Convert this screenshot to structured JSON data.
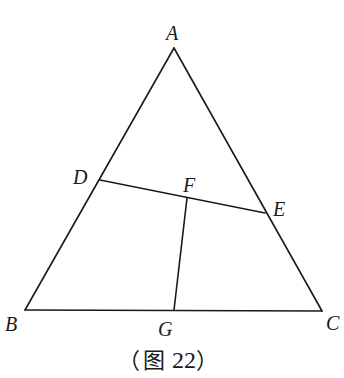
{
  "figure": {
    "caption_open": "（",
    "caption_char": "图",
    "caption_number": "22",
    "caption_close": "）",
    "line_color": "#1a1a1a"
  },
  "points": {
    "A": {
      "label": "A",
      "x": 174,
      "y": 48
    },
    "B": {
      "label": "B",
      "x": 25,
      "y": 310
    },
    "C": {
      "label": "C",
      "x": 322,
      "y": 311
    },
    "D": {
      "label": "D",
      "x": 100,
      "y": 180
    },
    "E": {
      "label": "E",
      "x": 265,
      "y": 213
    },
    "F": {
      "label": "F",
      "x": 187,
      "y": 198
    },
    "G": {
      "label": "G",
      "x": 174,
      "y": 310
    }
  },
  "segments": [
    {
      "from": "A",
      "to": "B"
    },
    {
      "from": "A",
      "to": "C"
    },
    {
      "from": "B",
      "to": "C"
    },
    {
      "from": "D",
      "to": "E"
    },
    {
      "from": "F",
      "to": "G"
    }
  ]
}
